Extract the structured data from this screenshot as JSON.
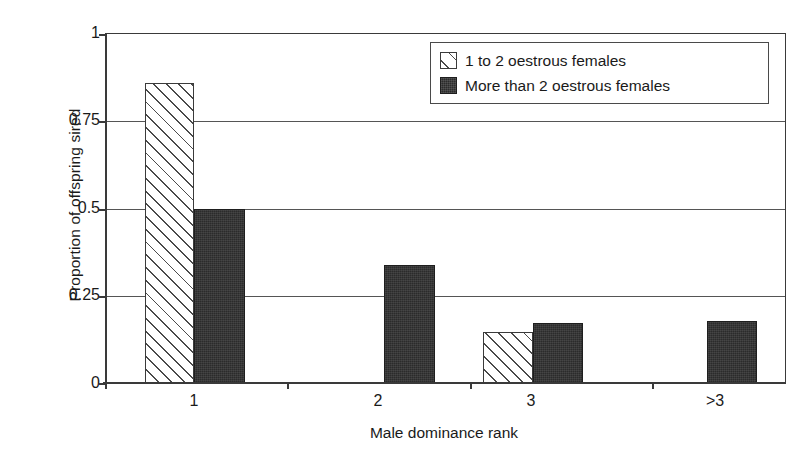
{
  "chart_data": {
    "type": "bar",
    "title": "",
    "xlabel": "Male dominance rank",
    "ylabel": "Proportion of offspring sired",
    "categories": [
      "1",
      "2",
      "3",
      ">3"
    ],
    "series": [
      {
        "name": "1 to 2 oestrous females",
        "style": "hatched",
        "values": [
          0.86,
          0,
          0.15,
          0
        ]
      },
      {
        "name": "More than 2 oestrous females",
        "style": "solid",
        "values": [
          0.5,
          0.34,
          0.175,
          0.18
        ]
      }
    ],
    "ylim": [
      0,
      1
    ],
    "yticks": [
      0,
      0.25,
      0.5,
      0.75,
      1
    ],
    "ytick_labels": [
      "0",
      "0.25",
      "0.5",
      "0.75",
      "1"
    ],
    "grid": "horizontal",
    "legend_position": "top-right"
  },
  "axis": {
    "ytick_0": "0",
    "ytick_1": "0.25",
    "ytick_2": "0.5",
    "ytick_3": "0.75",
    "ytick_4": "1",
    "xtick_0": "1",
    "xtick_1": "2",
    "xtick_2": "3",
    "xtick_3": ">3",
    "xlabel": "Male dominance rank",
    "ylabel": "Proportion of offspring sired"
  },
  "legend": {
    "item_1_label": "1 to 2 oestrous females",
    "item_2_label": "More than 2 oestrous females"
  },
  "colors": {
    "solid_fill": "#2b2b2b",
    "hatch_line": "#4a4a4a",
    "axis": "#3a3a3a",
    "grid": "#555555",
    "background": "#ffffff"
  }
}
